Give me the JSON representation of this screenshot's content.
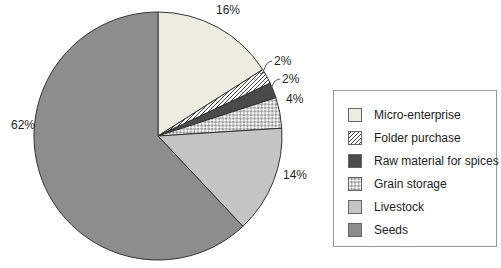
{
  "chart_data": {
    "type": "pie",
    "start_angle_deg": 0,
    "direction": "clockwise",
    "legend_position": "right",
    "slices": [
      {
        "label": "Micro-enterprise",
        "value": 16,
        "display": "16%",
        "fill": "#ececdf",
        "pattern": "solid"
      },
      {
        "label": "Folder purchase",
        "value": 2,
        "display": "2%",
        "fill": "#ffffff",
        "pattern": "diagonal-hatch"
      },
      {
        "label": "Raw material for spices",
        "value": 2,
        "display": "2%",
        "fill": "#4a4a4a",
        "pattern": "solid"
      },
      {
        "label": "Grain storage",
        "value": 4,
        "display": "4%",
        "fill": "#ffffff",
        "pattern": "checker"
      },
      {
        "label": "Livestock",
        "value": 14,
        "display": "14%",
        "fill": "#c4c4c4",
        "pattern": "solid"
      },
      {
        "label": "Seeds",
        "value": 62,
        "display": "62%",
        "fill": "#8d8d8d",
        "pattern": "solid"
      }
    ],
    "colors": {
      "outline": "#333333",
      "hatch_line": "#444444",
      "checker_dot": "#999999",
      "label_text": "#1f1f1f",
      "legend_border": "#999999",
      "background": "#ffffff"
    }
  }
}
